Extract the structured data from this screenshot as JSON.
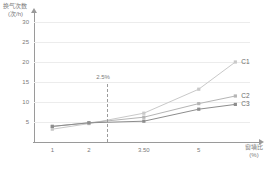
{
  "chart_data": {
    "type": "line",
    "title": "",
    "xlabel": "窗墙比",
    "xlabel_unit": "(%)",
    "ylabel": "换气次数",
    "ylabel_unit": "(次/h)",
    "x": [
      1,
      2,
      3.5,
      5,
      6
    ],
    "xtick_labels": [
      "1",
      "2",
      "3.50",
      "5"
    ],
    "ytick_labels": [
      "5",
      "10",
      "15",
      "20",
      "25",
      "30"
    ],
    "xlim": [
      0.5,
      6.4
    ],
    "ylim": [
      0,
      32
    ],
    "grid": true,
    "legend_position": "right-inline",
    "annotations": [
      {
        "text": "2.5%",
        "x": 2.5,
        "type": "vertical-dashed-line"
      }
    ],
    "series": [
      {
        "name": "C1",
        "color": "#c9c9c9",
        "values": [
          3.2,
          4.6,
          7.2,
          13.2,
          20.0
        ]
      },
      {
        "name": "C2",
        "color": "#b5b5b5",
        "values": [
          3.9,
          4.8,
          6.2,
          9.6,
          11.5
        ]
      },
      {
        "name": "C3",
        "color": "#8d8d8d",
        "values": [
          3.9,
          4.8,
          5.2,
          8.2,
          9.4
        ]
      }
    ]
  },
  "axes": {
    "y_title_line1": "换气次数",
    "y_title_line2": "(次/h)",
    "x_title_line1": "窗墙比",
    "x_title_line2": "(%)"
  },
  "colors": {
    "grid": "#ececec",
    "axis": "#9a9a9a",
    "text": "#7a7a7a",
    "background": "#ffffff"
  }
}
